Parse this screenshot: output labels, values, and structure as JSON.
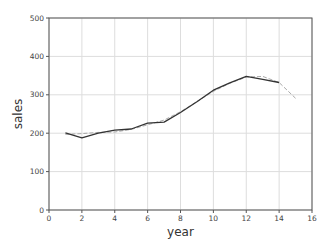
{
  "chart_data": {
    "type": "line",
    "title": "",
    "xlabel": "year",
    "ylabel": "sales",
    "xlim": [
      0,
      16
    ],
    "ylim": [
      0,
      500
    ],
    "xticks": [
      0,
      2,
      4,
      6,
      8,
      10,
      12,
      14,
      16
    ],
    "yticks": [
      0,
      100,
      200,
      300,
      400,
      500
    ],
    "grid": true,
    "legend": null,
    "series": [
      {
        "name": "actual",
        "style": "solid",
        "color": "#333333",
        "x": [
          1,
          2,
          3,
          4,
          5,
          6,
          7,
          8,
          9,
          10,
          11,
          12,
          13,
          14
        ],
        "values": [
          201,
          188,
          200,
          208,
          211,
          226,
          229,
          254,
          282,
          312,
          331,
          348,
          340,
          332
        ]
      },
      {
        "name": "fitted",
        "style": "dashed",
        "color": "#aaaaaa",
        "x": [
          1,
          2,
          3,
          4,
          5,
          6,
          7,
          8,
          9,
          10,
          11,
          12,
          13,
          14,
          15
        ],
        "values": [
          197,
          199,
          202,
          203,
          210,
          222,
          234,
          256,
          282,
          309,
          330,
          346,
          348,
          332,
          291
        ]
      }
    ]
  }
}
